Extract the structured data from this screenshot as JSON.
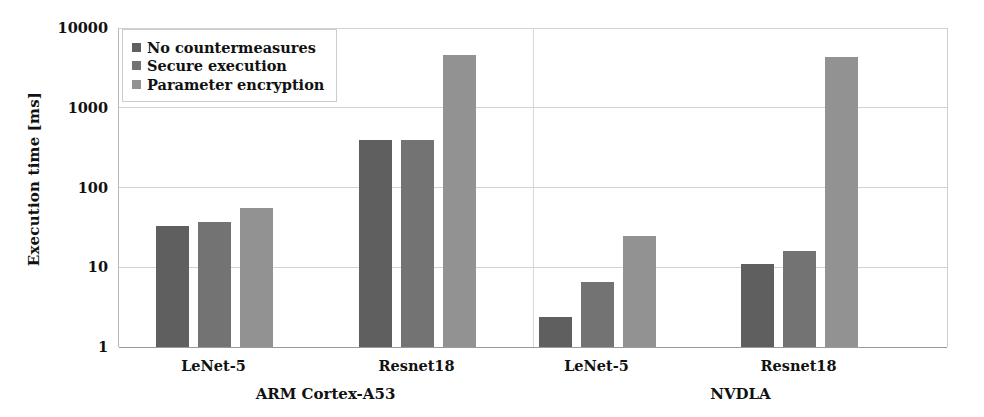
{
  "chart_data": {
    "type": "bar",
    "title": "",
    "xlabel": "",
    "ylabel": "Execution time [ms]",
    "yscale": "log",
    "ylim": [
      1,
      10000
    ],
    "yticks": [
      1,
      10,
      100,
      1000,
      10000
    ],
    "ytick_labels": [
      "1",
      "10",
      "100",
      "1000",
      "10000"
    ],
    "grid": true,
    "legend_position": "upper left",
    "categories": [
      "LeNet-5",
      "Resnet18",
      "LeNet-5",
      "Resnet18"
    ],
    "group_labels": [
      "ARM Cortex-A53",
      "NVDLA"
    ],
    "groups": [
      {
        "platform": "ARM Cortex-A53",
        "networks": [
          {
            "name": "LeNet-5",
            "values": [
              33,
              37,
              55
            ]
          },
          {
            "name": "Resnet18",
            "values": [
              390,
              390,
              4600
            ]
          }
        ]
      },
      {
        "platform": "NVDLA",
        "networks": [
          {
            "name": "LeNet-5",
            "values": [
              2.4,
              6.5,
              25
            ]
          },
          {
            "name": "Resnet18",
            "values": [
              11,
              16,
              4300
            ]
          }
        ]
      }
    ],
    "series": [
      {
        "name": "No countermeasures",
        "color": "#5f5f5f",
        "values": [
          33,
          390,
          2.4,
          11
        ]
      },
      {
        "name": "Secure execution",
        "color": "#737373",
        "values": [
          37,
          390,
          6.5,
          16
        ]
      },
      {
        "name": "Parameter encryption",
        "color": "#929292",
        "values": [
          55,
          4600,
          25,
          4300
        ]
      }
    ]
  },
  "legend": {
    "items": [
      {
        "label": "No countermeasures",
        "color": "#5f5f5f"
      },
      {
        "label": "Secure execution",
        "color": "#737373"
      },
      {
        "label": "Parameter encryption",
        "color": "#929292"
      }
    ]
  },
  "axis": {
    "y_title": "Execution time [ms]",
    "y_tick_labels": [
      "10000",
      "1000",
      "100",
      "10",
      "1"
    ]
  },
  "x_axis": {
    "network_labels": [
      "LeNet-5",
      "Resnet18",
      "LeNet-5",
      "Resnet18"
    ],
    "platform_labels": [
      "ARM Cortex-A53",
      "NVDLA"
    ]
  }
}
